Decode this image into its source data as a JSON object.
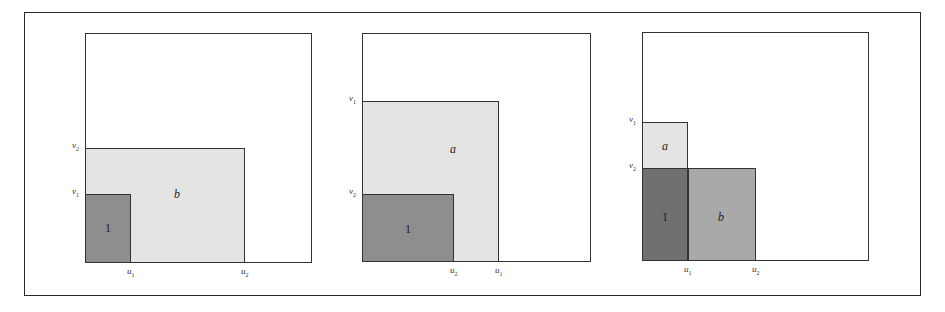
{
  "figure": {
    "panels": [
      {
        "id": "panel-1",
        "box": {
          "left": 85,
          "top": 33,
          "right": 312,
          "bottom": 263
        },
        "rects": [
          {
            "name": "region-b",
            "label": "b",
            "italic": true,
            "left": 85,
            "top": 148,
            "right": 245,
            "bottom": 263,
            "shade": "light",
            "fill": "#e4e4e4",
            "label_x": 177,
            "label_y": 194
          },
          {
            "name": "region-1",
            "label": "1",
            "italic": false,
            "left": 85,
            "top": 194,
            "right": 131,
            "bottom": 263,
            "shade": "dark",
            "fill": "#8e8e8e",
            "label_x": 108,
            "label_y": 228
          }
        ],
        "y_labels": [
          {
            "var": "v",
            "sub": "2",
            "y": 148
          },
          {
            "var": "v",
            "sub": "1",
            "y": 194
          }
        ],
        "x_labels": [
          {
            "var": "u",
            "sub": "1",
            "x": 131
          },
          {
            "var": "u",
            "sub": "2",
            "x": 245
          }
        ]
      },
      {
        "id": "panel-2",
        "box": {
          "left": 362,
          "top": 33,
          "right": 591,
          "bottom": 262
        },
        "rects": [
          {
            "name": "region-a",
            "label": "a",
            "italic": true,
            "left": 362,
            "top": 101,
            "right": 499,
            "bottom": 262,
            "shade": "light",
            "fill": "#e4e4e4",
            "label_x": 453,
            "label_y": 149
          },
          {
            "name": "region-1",
            "label": "1",
            "italic": false,
            "left": 362,
            "top": 194,
            "right": 454,
            "bottom": 262,
            "shade": "dark",
            "fill": "#8e8e8e",
            "label_x": 408,
            "label_y": 229
          }
        ],
        "y_labels": [
          {
            "var": "v",
            "sub": "1",
            "y": 101
          },
          {
            "var": "v",
            "sub": "2",
            "y": 194
          }
        ],
        "x_labels": [
          {
            "var": "u",
            "sub": "2",
            "x": 454
          },
          {
            "var": "u",
            "sub": "1",
            "x": 499
          }
        ]
      },
      {
        "id": "panel-3",
        "box": {
          "left": 642,
          "top": 32,
          "right": 869,
          "bottom": 261
        },
        "rects": [
          {
            "name": "region-a",
            "label": "a",
            "italic": true,
            "left": 642,
            "top": 122,
            "right": 688,
            "bottom": 169,
            "shade": "light",
            "fill": "#e4e4e4",
            "label_x": 665,
            "label_y": 146
          },
          {
            "name": "region-b",
            "label": "b",
            "italic": true,
            "left": 688,
            "top": 168,
            "right": 756,
            "bottom": 261,
            "shade": "mid",
            "fill": "#a9a9a9",
            "label_x": 721,
            "label_y": 217
          },
          {
            "name": "region-1",
            "label": "1",
            "italic": false,
            "left": 642,
            "top": 168,
            "right": 688,
            "bottom": 261,
            "shade": "darker",
            "fill": "#707070",
            "label_x": 665,
            "label_y": 217
          }
        ],
        "y_labels": [
          {
            "var": "v",
            "sub": "1",
            "y": 122
          },
          {
            "var": "v",
            "sub": "2",
            "y": 168
          }
        ],
        "x_labels": [
          {
            "var": "u",
            "sub": "1",
            "x": 688
          },
          {
            "var": "u",
            "sub": "2",
            "x": 756
          }
        ]
      }
    ]
  }
}
